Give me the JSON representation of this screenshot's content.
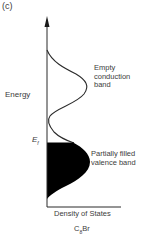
{
  "figure": {
    "panel_label": "(c)",
    "y_axis_label": "Energy",
    "x_axis_label": "Density of States",
    "fermi_level": {
      "symbol": "E",
      "subscript": "f"
    },
    "compound": {
      "prefix": "C",
      "subscript": "8",
      "suffix": "Br"
    },
    "bands": [
      {
        "name": "conduction",
        "label_lines": [
          "Empty",
          "conduction",
          "band"
        ],
        "filled": false
      },
      {
        "name": "valence",
        "label_lines": [
          "Partially filled",
          "valence band"
        ],
        "filled": true
      }
    ],
    "colors": {
      "curve": "#2a2a2a",
      "fill": "#000000",
      "text": "#3c3c3c",
      "background": "#ffffff"
    }
  }
}
